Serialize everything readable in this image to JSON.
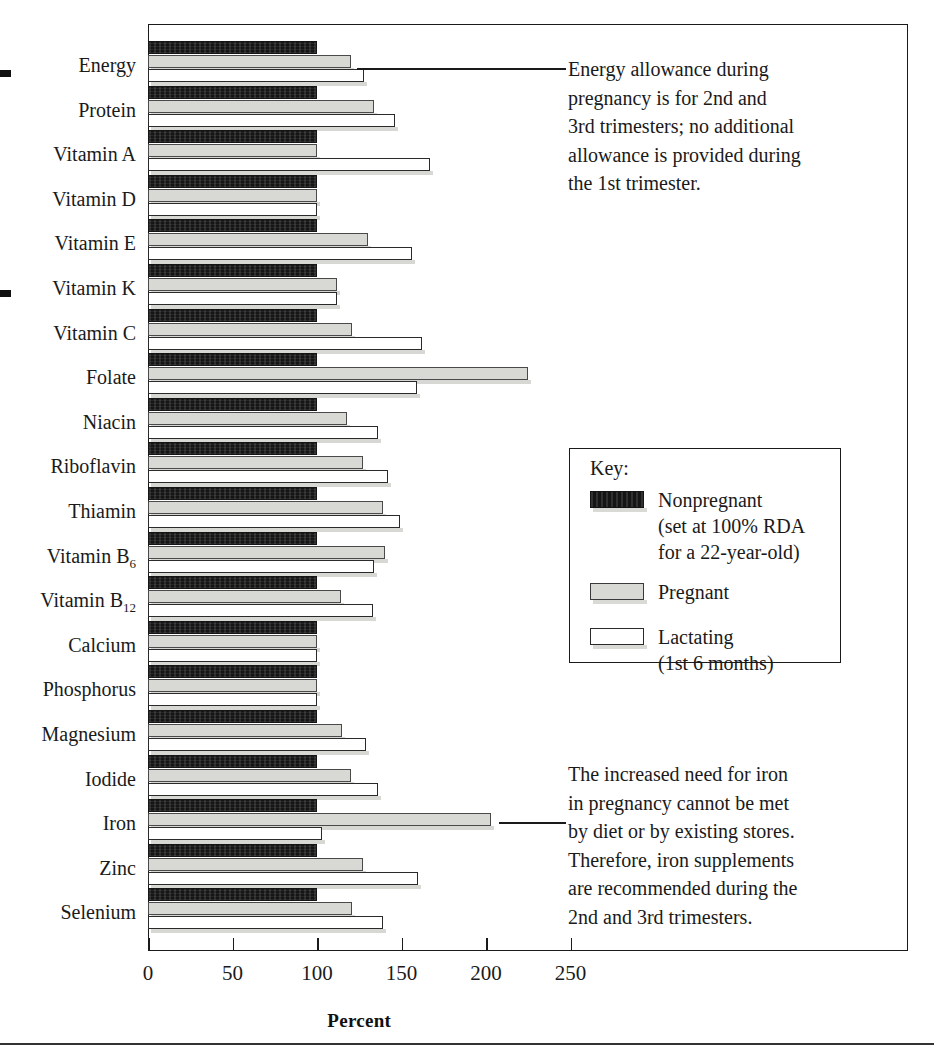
{
  "chart_data": {
    "type": "bar",
    "orientation": "horizontal",
    "title": "",
    "xlabel": "Percent",
    "ylabel": "",
    "xlim": [
      0,
      320
    ],
    "xticks": [
      0,
      50,
      100,
      150,
      200,
      250
    ],
    "xtick_labels": [
      "0",
      "50",
      "100",
      "150",
      "200",
      "250"
    ],
    "grid": false,
    "legend_position": "inside-right-middle",
    "categories": [
      "Energy",
      "Protein",
      "Vitamin A",
      "Vitamin D",
      "Vitamin E",
      "Vitamin K",
      "Vitamin C",
      "Folate",
      "Niacin",
      "Riboflavin",
      "Thiamin",
      "Vitamin B6",
      "Vitamin B12",
      "Calcium",
      "Phosphorus",
      "Magnesium",
      "Iodide",
      "Iron",
      "Zinc",
      "Selenium"
    ],
    "category_labels_html": [
      "Energy",
      "Protein",
      "Vitamin A",
      "Vitamin D",
      "Vitamin E",
      "Vitamin K",
      "Vitamin C",
      "Folate",
      "Niacin",
      "Riboflavin",
      "Thiamin",
      "Vitamin B<sub>6</sub>",
      "Vitamin B<sub>12</sub>",
      "Calcium",
      "Phosphorus",
      "Magnesium",
      "Iodide",
      "Iron",
      "Zinc",
      "Selenium"
    ],
    "series": [
      {
        "name": "Nonpregnant",
        "style": "black-textured",
        "values": [
          100,
          100,
          100,
          100,
          100,
          100,
          100,
          100,
          100,
          100,
          100,
          100,
          100,
          100,
          100,
          100,
          100,
          100,
          100,
          100
        ]
      },
      {
        "name": "Pregnant",
        "style": "light-gray",
        "values": [
          120,
          134,
          100,
          100,
          130,
          112,
          121,
          225,
          118,
          127,
          139,
          140,
          114,
          100,
          100,
          115,
          120,
          203,
          127,
          121
        ]
      },
      {
        "name": "Lactating",
        "style": "white-outline",
        "values": [
          128,
          146,
          167,
          100,
          156,
          112,
          162,
          159,
          136,
          142,
          149,
          134,
          133,
          100,
          100,
          129,
          136,
          103,
          160,
          139
        ]
      }
    ]
  },
  "legend": {
    "title": "Key:",
    "entries": [
      {
        "label": "Nonpregnant",
        "sublines": [
          "(set at 100% RDA",
          "for a 22-year-old)"
        ],
        "swatch": "black-textured-swatch"
      },
      {
        "label": "Pregnant",
        "sublines": [],
        "swatch": "light-gray-swatch"
      },
      {
        "label": "Lactating",
        "sublines": [
          "(1st 6 months)"
        ],
        "swatch": "white-outline-swatch"
      }
    ]
  },
  "annotations": [
    {
      "id": "energy-note",
      "target": "Energy",
      "lines": [
        "Energy allowance during",
        "pregnancy is for 2nd and",
        "3rd trimesters; no additional",
        "allowance is provided during",
        "the 1st trimester."
      ]
    },
    {
      "id": "iron-note",
      "target": "Iron",
      "lines": [
        "The increased need for iron",
        "in pregnancy cannot be met",
        "by diet or by existing stores.",
        "Therefore, iron supplements",
        "are recommended during the",
        "2nd and 3rd trimesters."
      ]
    }
  ]
}
